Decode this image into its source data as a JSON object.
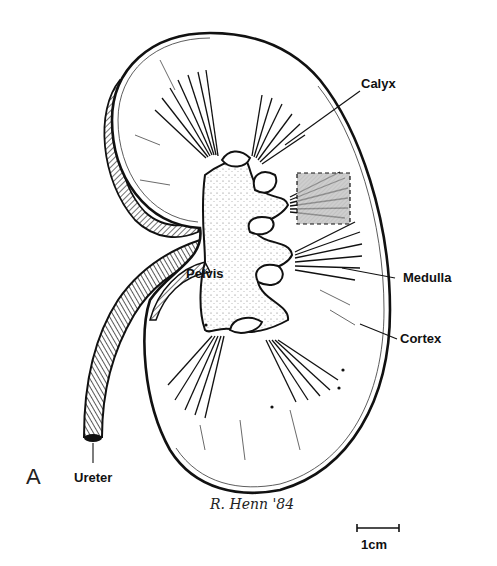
{
  "figure": {
    "panel_letter": "A",
    "labels": {
      "calyx": "Calyx",
      "pelvis": "Pelvis",
      "medulla": "Medulla",
      "cortex": "Cortex",
      "ureter": "Ureter"
    },
    "signature": "R. Henn '84",
    "scale_bar": {
      "label": "1cm"
    },
    "highlight_box": {
      "style": "dashed",
      "fill": "#b8b8b8"
    },
    "colors": {
      "ink": "#111111",
      "paper": "#ffffff",
      "stipple": "#555555"
    }
  }
}
